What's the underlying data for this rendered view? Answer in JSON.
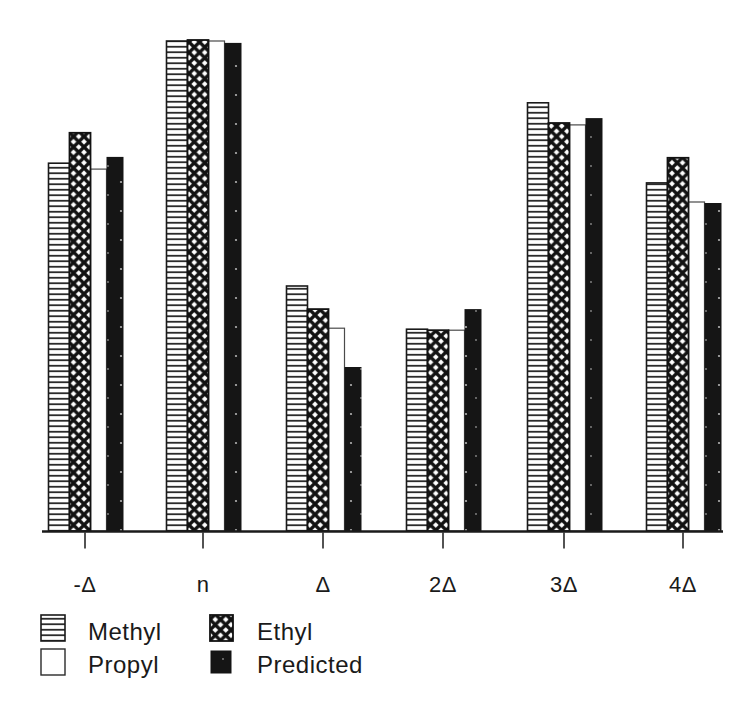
{
  "figure": {
    "background_color": "#ffffff",
    "ink_color": "#1a1a1a"
  },
  "chart_data": {
    "type": "bar",
    "title": "",
    "xlabel": "",
    "ylabel": "",
    "value_units": "relative bar height, % of tallest bar (no y-axis shown in figure)",
    "ylim": [
      0,
      100
    ],
    "grid": false,
    "legend_position": "bottom-left, two columns",
    "categories": [
      "-Δ",
      "n",
      "Δ",
      "2Δ",
      "3Δ",
      "4Δ"
    ],
    "bar_order_in_group": [
      "Methyl",
      "Ethyl",
      "Propyl",
      "Predicted"
    ],
    "series": [
      {
        "name": "Methyl",
        "swatch": "horizontal-lines",
        "values": [
          74.9,
          99.8,
          49.9,
          41.1,
          87.2,
          70.9
        ]
      },
      {
        "name": "Ethyl",
        "swatch": "crosshatch-diamond",
        "values": [
          81.1,
          100.0,
          45.2,
          40.9,
          83.1,
          76.0
        ]
      },
      {
        "name": "Propyl",
        "swatch": "white-empty",
        "values": [
          73.7,
          99.8,
          41.3,
          40.9,
          82.7,
          67.0
        ]
      },
      {
        "name": "Predicted",
        "swatch": "solid-black",
        "values": [
          76.2,
          99.4,
          33.4,
          45.2,
          84.1,
          66.8
        ]
      }
    ]
  }
}
